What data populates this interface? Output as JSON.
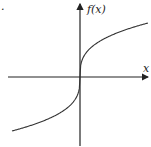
{
  "chart_data": {
    "type": "line",
    "title": "",
    "function": "f(x) = cube root of x",
    "xlabel": "x",
    "ylabel": "f(x)",
    "grid": false,
    "legend": null,
    "x": [
      -4,
      -3,
      -2,
      -1,
      -0.5,
      -0.1,
      0,
      0.1,
      0.5,
      1,
      2,
      3,
      4
    ],
    "series": [
      {
        "name": "f(x)",
        "values": [
          -1.587,
          -1.442,
          -1.26,
          -1.0,
          -0.794,
          -0.464,
          0,
          0.464,
          0.794,
          1.0,
          1.26,
          1.442,
          1.587
        ]
      }
    ],
    "colors": {
      "axes": "#222222",
      "curve": "#333333"
    }
  },
  "labels": {
    "x_axis": "x",
    "y_axis": "f(x)",
    "dot": "."
  }
}
